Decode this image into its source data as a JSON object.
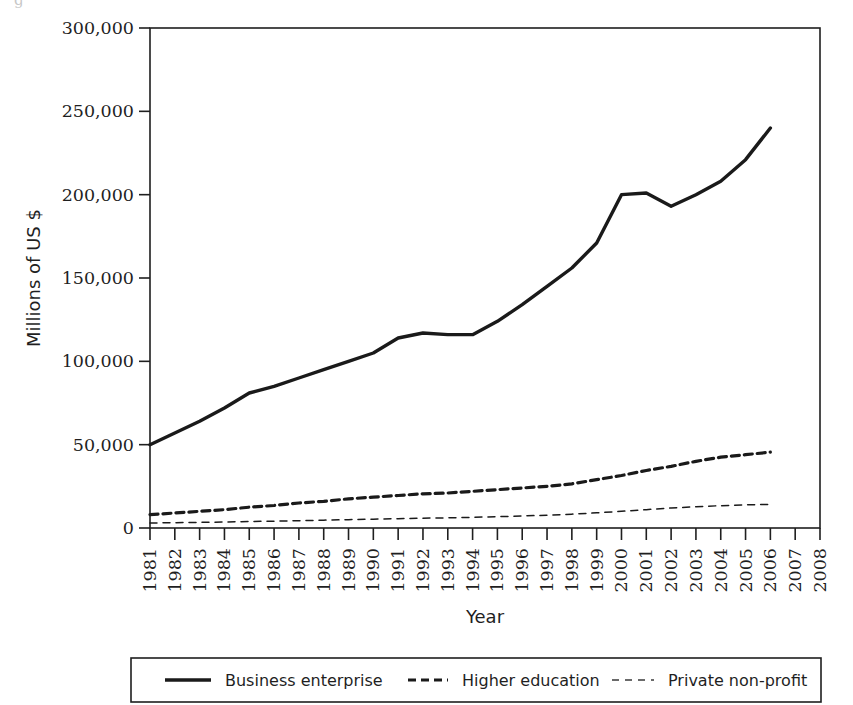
{
  "figure": {
    "caption_fragment": "g",
    "background_color": "#ffffff",
    "ink_color": "#1a1a1a"
  },
  "chart_data": {
    "type": "line",
    "title": "",
    "xlabel": "Year",
    "ylabel": "Millions of US $",
    "xlim": [
      1981,
      2008
    ],
    "ylim": [
      0,
      300000
    ],
    "grid": false,
    "legend_position": "bottom",
    "y_ticks": [
      0,
      50000,
      100000,
      150000,
      200000,
      250000,
      300000
    ],
    "y_tick_labels": [
      "0",
      "50,000",
      "100,000",
      "150,000",
      "200,000",
      "250,000",
      "300,000"
    ],
    "x_ticks": [
      1981,
      1982,
      1983,
      1984,
      1985,
      1986,
      1987,
      1988,
      1989,
      1990,
      1991,
      1992,
      1993,
      1994,
      1995,
      1996,
      1997,
      1998,
      1999,
      2000,
      2001,
      2002,
      2003,
      2004,
      2005,
      2006,
      2007,
      2008
    ],
    "x_tick_labels": [
      "1981",
      "1982",
      "1983",
      "1984",
      "1985",
      "1986",
      "1987",
      "1988",
      "1989",
      "1990",
      "1991",
      "1992",
      "1993",
      "1994",
      "1995",
      "1996",
      "1997",
      "1998",
      "1999",
      "2000",
      "2001",
      "2002",
      "2003",
      "2004",
      "2005",
      "2006",
      "2007",
      "2008"
    ],
    "x": [
      1981,
      1982,
      1983,
      1984,
      1985,
      1986,
      1987,
      1988,
      1989,
      1990,
      1991,
      1992,
      1993,
      1994,
      1995,
      1996,
      1997,
      1998,
      1999,
      2000,
      2001,
      2002,
      2003,
      2004,
      2005,
      2006
    ],
    "series": [
      {
        "name": "Business enterprise",
        "style": "solid",
        "stroke_width": 3.4,
        "color": "#1a1a1a",
        "values": [
          50000,
          57000,
          64000,
          72000,
          81000,
          85000,
          90000,
          95000,
          100000,
          105000,
          114000,
          117000,
          116000,
          116000,
          124000,
          134000,
          145000,
          156000,
          171000,
          200000,
          201000,
          193000,
          200000,
          208000,
          221000,
          240000
        ]
      },
      {
        "name": "Higher education",
        "style": "dashed",
        "stroke_width": 3.2,
        "color": "#1a1a1a",
        "values": [
          8000,
          9000,
          10000,
          11000,
          12500,
          13500,
          15000,
          16000,
          17500,
          18500,
          19500,
          20500,
          21000,
          22000,
          23000,
          24000,
          25000,
          26500,
          29000,
          31500,
          34500,
          37000,
          40000,
          42500,
          44000,
          45500
        ]
      },
      {
        "name": "Private non-profit",
        "style": "thin-dashed",
        "stroke_width": 1.5,
        "color": "#3a3a3a",
        "values": [
          3000,
          3200,
          3400,
          3600,
          3900,
          4100,
          4400,
          4700,
          5000,
          5300,
          5600,
          5900,
          6100,
          6400,
          6800,
          7200,
          7700,
          8300,
          9100,
          10000,
          11000,
          12000,
          12800,
          13400,
          13900,
          14200
        ]
      }
    ]
  },
  "legend": {
    "items": [
      {
        "label": "Business enterprise",
        "swatch": "solid-line-swatch"
      },
      {
        "label": "Higher education",
        "swatch": "dashed-line-swatch"
      },
      {
        "label": "Private non-profit",
        "swatch": "thin-dashed-line-swatch"
      }
    ]
  }
}
